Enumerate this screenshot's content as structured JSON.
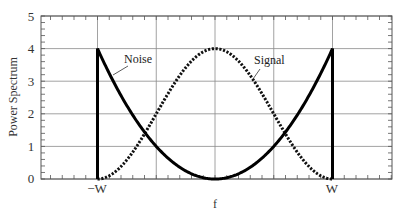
{
  "chart_data": {
    "type": "line",
    "title": "",
    "xlabel": "f",
    "ylabel": "Power Spectrum",
    "xlim": [
      -1.5,
      1.5
    ],
    "ylim": [
      0,
      5
    ],
    "grid": true,
    "x_ticks": [
      {
        "value": -1,
        "label": "−W"
      },
      {
        "value": 1,
        "label": "W"
      }
    ],
    "x_gridlines": [
      -1,
      -0.5,
      0,
      0.5,
      1
    ],
    "y_ticks": [
      0,
      1,
      2,
      3,
      4,
      5
    ],
    "y_tick_labels": [
      "0",
      "1",
      "2",
      "3",
      "4",
      "5"
    ],
    "legend": null,
    "series": [
      {
        "name": "Noise",
        "style": "solid-thick",
        "color": "#000000",
        "formula": "4*(f/W)^2 for |f|<=W, with vertical drops to 0 at f=±W",
        "x": [
          -1,
          -1,
          -0.75,
          -0.5,
          -0.25,
          0,
          0.25,
          0.5,
          0.75,
          1,
          1
        ],
        "values": [
          0,
          4,
          2.25,
          1,
          0.25,
          0,
          0.25,
          1,
          2.25,
          4,
          0
        ]
      },
      {
        "name": "Signal",
        "style": "dotted-thick",
        "color": "#000000",
        "formula": "4*cos^2(pi*f/(2W)) for |f|<=W",
        "x": [
          -1,
          -0.75,
          -0.5,
          -0.25,
          0,
          0.25,
          0.5,
          0.75,
          1
        ],
        "values": [
          0,
          0.59,
          2,
          3.41,
          4,
          3.41,
          2,
          0.59,
          0
        ]
      }
    ],
    "annotations": [
      {
        "text": "Noise",
        "points_to": "Noise curve near f=-0.85W"
      },
      {
        "text": "Signal",
        "points_to": "Signal curve near f=0.5W"
      }
    ]
  },
  "labels": {
    "xlabel": "f",
    "ylabel": "Power Spectrum",
    "neg_w": "−W",
    "pos_w": "W",
    "noise": "Noise",
    "signal": "Signal",
    "y0": "0",
    "y1": "1",
    "y2": "2",
    "y3": "3",
    "y4": "4",
    "y5": "5"
  }
}
